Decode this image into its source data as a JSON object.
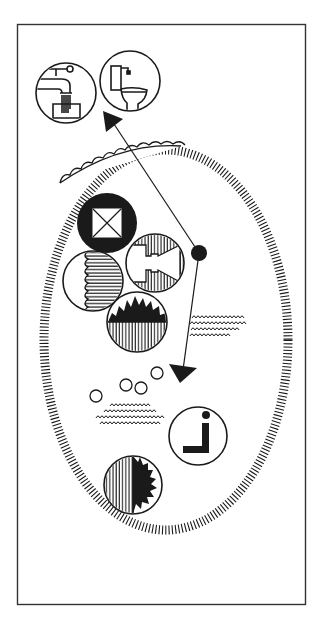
{
  "diagram": {
    "title": "",
    "colors": {
      "ink": "#1a1a1a",
      "background": "#ffffff",
      "frame": "#333333"
    },
    "frame": {
      "x": 17,
      "y": 24,
      "width": 288,
      "height": 581
    },
    "boundary": {
      "shape": "hatched-oval",
      "cx": 166,
      "cy": 340,
      "rx": 122,
      "ry": 190
    },
    "symbols": [
      {
        "id": "tap",
        "label": "water tap",
        "cx": 66,
        "cy": 93,
        "r": 30
      },
      {
        "id": "toilet",
        "label": "toilet",
        "cx": 130,
        "cy": 81,
        "r": 30
      },
      {
        "id": "gate",
        "label": "square with cross (entrance)",
        "cx": 107,
        "cy": 223,
        "r": 30
      },
      {
        "id": "waves-half",
        "label": "half-filled horizontal hatch",
        "cx": 93,
        "cy": 281,
        "r": 30
      },
      {
        "id": "bridge",
        "label": "hatched circle with passage",
        "cx": 155,
        "cy": 263,
        "r": 29
      },
      {
        "id": "sunburst-horizon",
        "label": "sun over hatched ground",
        "cx": 137,
        "cy": 322,
        "r": 30
      },
      {
        "id": "person-seated",
        "label": "seated person / information",
        "cx": 198,
        "cy": 436,
        "r": 29
      },
      {
        "id": "sunburst-vertical",
        "label": "half hatched with spiky shape",
        "cx": 133,
        "cy": 485,
        "r": 29
      }
    ],
    "junction": {
      "cx": 199,
      "cy": 253,
      "r": 8
    },
    "arrows": [
      {
        "id": "arrow-up",
        "from": [
          199,
          253
        ],
        "to": [
          103,
          112
        ],
        "target": "services"
      },
      {
        "id": "arrow-down",
        "from": [
          199,
          253
        ],
        "to": [
          180,
          383
        ],
        "target": "inner-area"
      }
    ],
    "bubbles": [
      {
        "cx": 157,
        "cy": 373,
        "r": 6
      },
      {
        "cx": 126,
        "cy": 385,
        "r": 6
      },
      {
        "cx": 141,
        "cy": 388,
        "r": 6
      },
      {
        "cx": 96,
        "cy": 396,
        "r": 6
      }
    ],
    "mound": {
      "label": "scalloped mound",
      "from": [
        60,
        182
      ],
      "to": [
        180,
        141
      ]
    },
    "textures": [
      {
        "id": "scrub-right",
        "label": "scrub/grass texture",
        "x": 190,
        "y": 316,
        "width": 62,
        "height": 24
      },
      {
        "id": "scrub-left",
        "label": "scrub/grass texture",
        "x": 95,
        "y": 400,
        "width": 72,
        "height": 26
      }
    ]
  }
}
